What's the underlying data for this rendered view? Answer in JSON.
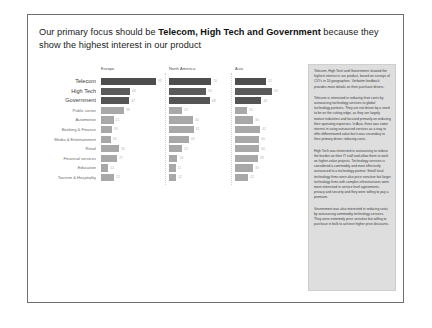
{
  "slide": {
    "headline_prefix": "Our primary focus should be ",
    "headline_emphasis": "Telecom, High Tech and Government",
    "headline_suffix": " because they show the highest interest in our product"
  },
  "chart_data": {
    "type": "bar",
    "xlabel": "",
    "ylabel": "",
    "grid": false,
    "legend_position": "none",
    "xlim": [
      0,
      100
    ],
    "categories": [
      "Telecom",
      "High Tech",
      "Government",
      "Public sector",
      "Automotive",
      "Banking & Finance",
      "Media & Entertainment",
      "Retail",
      "Financial services",
      "Education",
      "Tourism & Hospitality"
    ],
    "highlighted_categories": [
      "Telecom",
      "High Tech",
      "Government"
    ],
    "panels": [
      {
        "name": "Europe",
        "values": [
          92,
          48,
          47,
          38,
          21,
          18,
          16,
          30,
          27,
          12,
          22
        ]
      },
      {
        "name": "North America",
        "values": [
          70,
          62,
          68,
          22,
          40,
          41,
          33,
          22,
          14,
          11,
          12
        ]
      },
      {
        "name": "Asia",
        "values": [
          52,
          62,
          44,
          20,
          30,
          42,
          40,
          40,
          38,
          30,
          22
        ]
      }
    ],
    "colors": {
      "highlight_bar": "#4d4d4d",
      "normal_bar": "#a8a8a8",
      "value_label": "#b4b4b4",
      "panel_divider": "#cfcfcf"
    }
  },
  "narrative": {
    "paragraphs": [
      "Telecom, High Tech and Government showed the highest interest in our product, based on surveys of CIO's in 10 geographies. Verbatim feedback provides more details on their purchase drivers.",
      "Telecom is interested in reducing their costs by outsourcing technology services to global technology partners. They are not driven by a need to be on the cutting edge, as they are largely mature industries and focused primarily on reducing their operating expenses. In Asia, there was some interest in using outsourced services as a way to offer differentiated value but it was secondary to their primary driver, reducing costs.",
      "High Tech was interested in outsourcing to reduce the burden on their IT staff and allow them to work on higher-value projects. Technology services is considered a commodity and most effectively outsourced to a technology partner. Small local technology firms were also price sensitive but larger technology firms with complex infrastructures were more interested in service level agreements, privacy and security and they were willing to pay a premium.",
      "Government was also interested in reducing costs by outsourcing commodity technology services. They were extremely price sensitive but willing to purchase in bulk to achieve higher price discounts."
    ]
  }
}
